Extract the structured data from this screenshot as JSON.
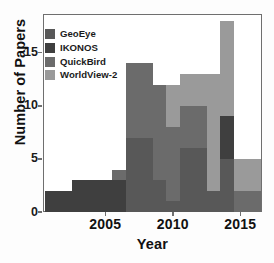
{
  "chart_data": {
    "type": "bar",
    "stacked": true,
    "title": "",
    "xlabel": "Year",
    "ylabel": "Number of Papers",
    "categories": [
      2001,
      2002,
      2003,
      2004,
      2005,
      2006,
      2007,
      2008,
      2009,
      2010,
      2011,
      2012,
      2013,
      2014,
      2015,
      2016
    ],
    "xtick_labels": [
      "2005",
      "2010",
      "2015"
    ],
    "xticks": [
      2005,
      2010,
      2015
    ],
    "ytick_labels": [
      "0",
      "5",
      "10",
      "15"
    ],
    "yticks": [
      0,
      5,
      10,
      15
    ],
    "ylim": [
      0,
      18.5
    ],
    "xlim": [
      2000.5,
      2016.5
    ],
    "grid": false,
    "legend_position": "upper-left",
    "series": [
      {
        "name": "GeoEye",
        "color": "#585858",
        "values": [
          0,
          0,
          0,
          0,
          0,
          0,
          7,
          7,
          3,
          1,
          6,
          6,
          2,
          5,
          0,
          0
        ]
      },
      {
        "name": "IKONOS",
        "color": "#3f3f3f",
        "values": [
          2,
          2,
          3,
          3,
          3,
          3,
          0,
          0,
          0,
          0,
          0,
          0,
          0,
          4,
          0,
          0
        ]
      },
      {
        "name": "QuickBird",
        "color": "#6b6b6b",
        "values": [
          0,
          0,
          0,
          0,
          0,
          1,
          7,
          7,
          9,
          7,
          4,
          4,
          0,
          0,
          2,
          2
        ]
      },
      {
        "name": "WorldView-2",
        "color": "#9a9a9a",
        "values": [
          0,
          0,
          0,
          0,
          0,
          0,
          0,
          0,
          0,
          4,
          3,
          3,
          11,
          9,
          3,
          3
        ]
      }
    ],
    "totals": [
      2,
      2,
      3,
      3,
      3,
      4,
      14,
      14,
      12,
      12,
      13,
      13,
      13,
      18,
      5,
      5
    ]
  },
  "legend": {
    "items": [
      {
        "label": "GeoEye",
        "color": "#585858"
      },
      {
        "label": "IKONOS",
        "color": "#3f3f3f"
      },
      {
        "label": "QuickBird",
        "color": "#6b6b6b"
      },
      {
        "label": "WorldView-2",
        "color": "#9a9a9a"
      }
    ]
  },
  "axes": {
    "frame_color": "#6f6f6f",
    "text_color": "#111111"
  }
}
